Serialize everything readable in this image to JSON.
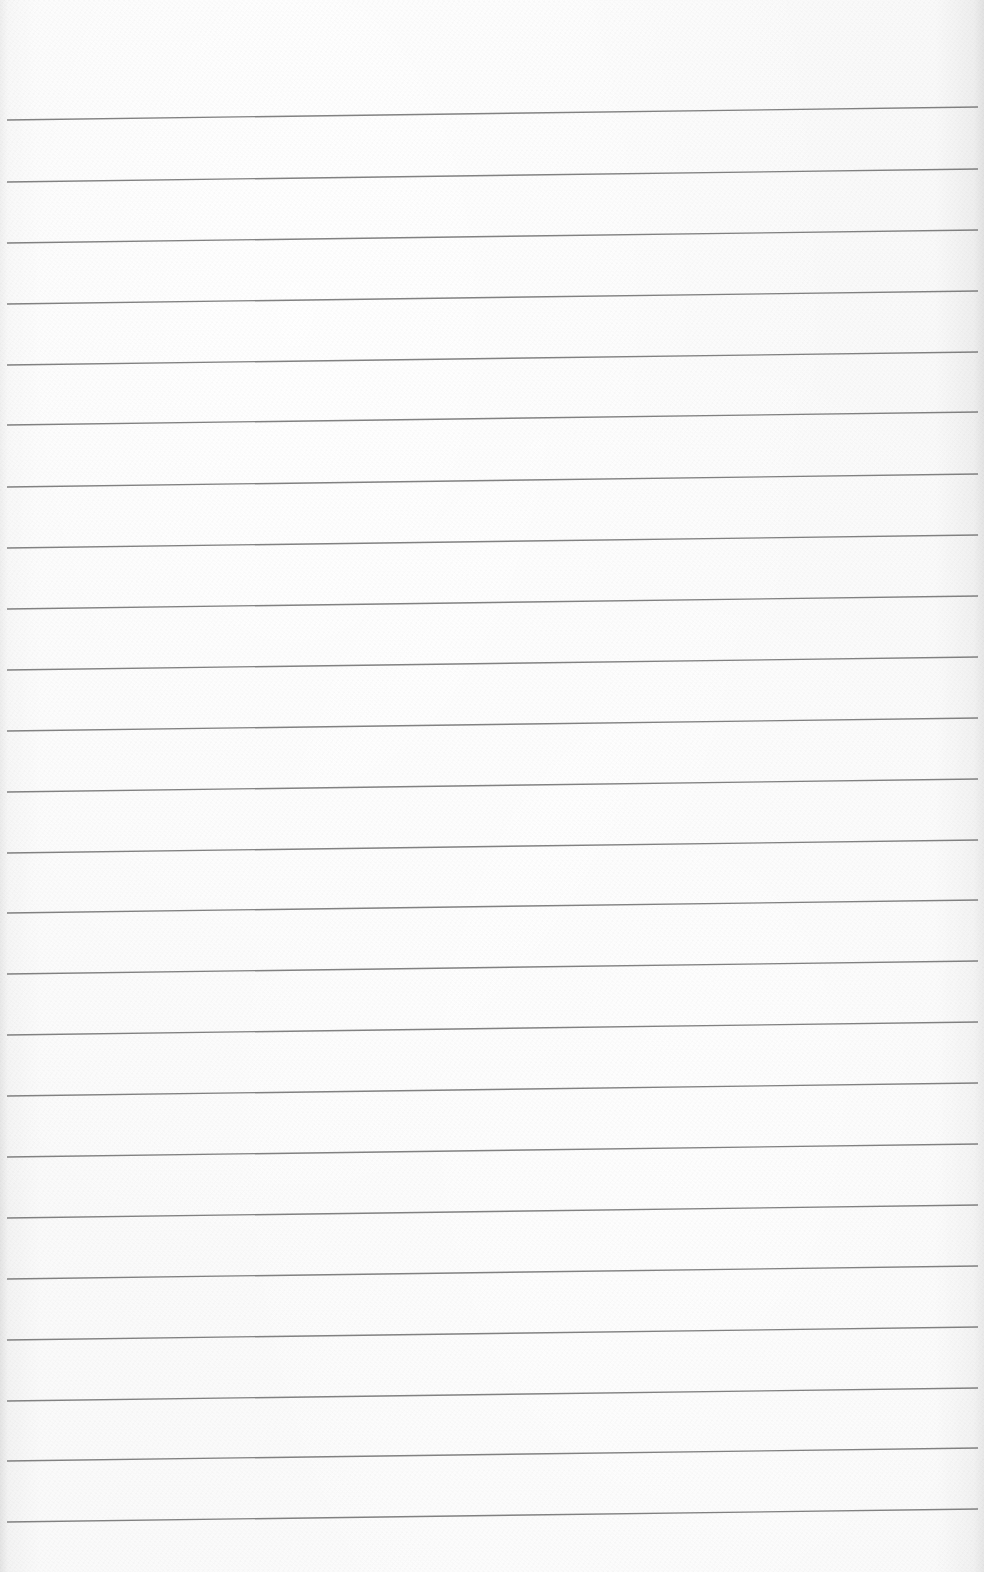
{
  "page": {
    "type": "lined-paper",
    "background_color": "#f7f7f7",
    "line_color": "#6b6b6b",
    "line_count": 24,
    "line_x_start": 7,
    "line_x_end": 978,
    "line_slope_px": -13,
    "line_y_left": [
      120,
      182,
      243,
      304,
      365,
      425,
      487,
      548,
      609,
      670,
      731,
      792,
      853,
      913,
      974,
      1035,
      1096,
      1157,
      1218,
      1279,
      1340,
      1401,
      1461,
      1522
    ]
  }
}
